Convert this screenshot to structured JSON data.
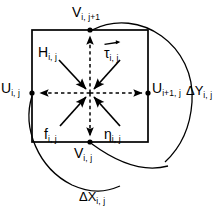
{
  "figure": {
    "type": "staggered-grid-cell-diagram",
    "cell": {
      "left": 32,
      "top": 30,
      "right": 148,
      "bottom": 142,
      "center_x": 90,
      "center_y": 93
    },
    "colors": {
      "stroke": "#000000",
      "background": "#ffffff",
      "text": "#000000"
    }
  },
  "labels": {
    "v_top": {
      "base": "V",
      "sub": "i, j+1"
    },
    "v_bottom": {
      "base": "V",
      "sub": "i, j"
    },
    "u_left": {
      "base": "U",
      "sub": "i, j"
    },
    "u_right": {
      "base": "U",
      "sub": "i+1, j"
    },
    "h_center": {
      "base": "H",
      "sub": "i, j"
    },
    "tau_center": {
      "base": "τ",
      "sub": "i, j"
    },
    "f_center": {
      "base": "f",
      "sub": "i, j"
    },
    "eta_center": {
      "base": "η",
      "sub": "i, j"
    },
    "delta_y": {
      "base": "ΔY",
      "sub": "i, j"
    },
    "delta_x": {
      "base": "ΔX",
      "sub": "i, j"
    }
  },
  "icons": {
    "vector_arrow": "vector-overbar-arrow",
    "point_marker": "grid-point-dot"
  }
}
